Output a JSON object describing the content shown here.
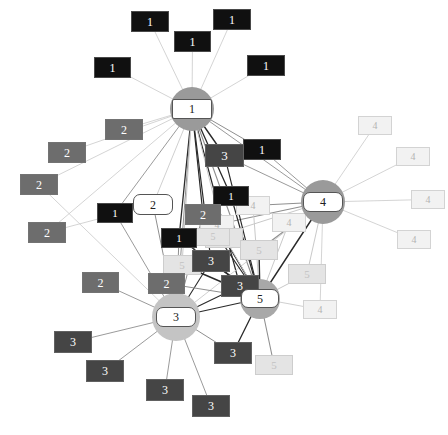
{
  "diagram": {
    "type": "node-link-graph",
    "width": 448,
    "height": 435,
    "background": "#ffffff"
  },
  "palette": {
    "class_1": "#101010",
    "class_1_text": "#ffffff",
    "class_2": "#6d6d6d",
    "class_2_text": "#ffffff",
    "class_3": "#454545",
    "class_3_text": "#ffffff",
    "class_4": "#f2f2f2",
    "class_4_text": "#b4b4b4",
    "class_5": "#e4e4e4",
    "class_5_text": "#c2c2c2",
    "hub_fill": "#ffffff",
    "hub_text": "#202020",
    "hub_border": "#555555",
    "halo_dark": "#9a9a9a",
    "halo_light": "#cfcfcf",
    "edge_light": "#c9c9c9",
    "edge_mid": "#8f8f8f",
    "edge_dark": "#2a2a2a"
  },
  "hubs": [
    {
      "id": "hub1",
      "label": "1",
      "x": 172,
      "y": 99,
      "w": 40,
      "h": 20,
      "halo_r": 22,
      "halo": "#9a9a9a",
      "shape": "octagon"
    },
    {
      "id": "hub4",
      "label": "4",
      "x": 303,
      "y": 192,
      "w": 40,
      "h": 20,
      "halo_r": 22,
      "halo": "#9a9a9a",
      "shape": "rect"
    },
    {
      "id": "hub3",
      "label": "3",
      "x": 156,
      "y": 307,
      "w": 40,
      "h": 20,
      "halo_r": 24,
      "halo": "#c4c4c4",
      "shape": "rect"
    },
    {
      "id": "hub5",
      "label": "5",
      "x": 241,
      "y": 289,
      "w": 38,
      "h": 19,
      "halo_r": 20,
      "halo": "#a8a8a8",
      "shape": "rect"
    },
    {
      "id": "hub2",
      "label": "2",
      "x": 133,
      "y": 194,
      "w": 40,
      "h": 21,
      "halo_r": 0,
      "halo": "none",
      "shape": "rect"
    }
  ],
  "leaves": [
    {
      "id": "n1a",
      "label": "1",
      "cls": "class_1",
      "x": 131,
      "y": 11,
      "w": 38,
      "h": 21
    },
    {
      "id": "n1b",
      "label": "1",
      "cls": "class_1",
      "x": 213,
      "y": 9,
      "w": 38,
      "h": 21
    },
    {
      "id": "n1c",
      "label": "1",
      "cls": "class_1",
      "x": 174,
      "y": 31,
      "w": 37,
      "h": 21
    },
    {
      "id": "n1d",
      "label": "1",
      "cls": "class_1",
      "x": 94,
      "y": 57,
      "w": 37,
      "h": 21
    },
    {
      "id": "n1e",
      "label": "1",
      "cls": "class_1",
      "x": 247,
      "y": 55,
      "w": 38,
      "h": 21
    },
    {
      "id": "n1f",
      "label": "1",
      "cls": "class_1",
      "x": 243,
      "y": 139,
      "w": 38,
      "h": 21
    },
    {
      "id": "n1g",
      "label": "1",
      "cls": "class_1",
      "x": 97,
      "y": 203,
      "w": 36,
      "h": 20
    },
    {
      "id": "n1h",
      "label": "1",
      "cls": "class_1",
      "x": 213,
      "y": 186,
      "w": 36,
      "h": 20
    },
    {
      "id": "n1i",
      "label": "1",
      "cls": "class_1",
      "x": 161,
      "y": 228,
      "w": 36,
      "h": 20
    },
    {
      "id": "n2a",
      "label": "2",
      "cls": "class_2",
      "x": 105,
      "y": 119,
      "w": 38,
      "h": 21
    },
    {
      "id": "n2b",
      "label": "2",
      "cls": "class_2",
      "x": 48,
      "y": 142,
      "w": 38,
      "h": 21
    },
    {
      "id": "n2c",
      "label": "2",
      "cls": "class_2",
      "x": 20,
      "y": 174,
      "w": 38,
      "h": 21
    },
    {
      "id": "n2d",
      "label": "2",
      "cls": "class_2",
      "x": 28,
      "y": 222,
      "w": 38,
      "h": 21
    },
    {
      "id": "n2e",
      "label": "2",
      "cls": "class_2",
      "x": 185,
      "y": 204,
      "w": 36,
      "h": 21
    },
    {
      "id": "n2f",
      "label": "2",
      "cls": "class_2",
      "x": 82,
      "y": 272,
      "w": 37,
      "h": 21
    },
    {
      "id": "n2g",
      "label": "2",
      "cls": "class_2",
      "x": 148,
      "y": 273,
      "w": 37,
      "h": 21
    },
    {
      "id": "n3a",
      "label": "3",
      "cls": "class_3",
      "x": 205,
      "y": 144,
      "w": 39,
      "h": 23
    },
    {
      "id": "n3b",
      "label": "3",
      "cls": "class_3",
      "x": 192,
      "y": 250,
      "w": 38,
      "h": 22
    },
    {
      "id": "n3c",
      "label": "3",
      "cls": "class_3",
      "x": 221,
      "y": 275,
      "w": 38,
      "h": 22
    },
    {
      "id": "n3d",
      "label": "3",
      "cls": "class_3",
      "x": 54,
      "y": 331,
      "w": 38,
      "h": 22
    },
    {
      "id": "n3e",
      "label": "3",
      "cls": "class_3",
      "x": 86,
      "y": 360,
      "w": 38,
      "h": 22
    },
    {
      "id": "n3f",
      "label": "3",
      "cls": "class_3",
      "x": 146,
      "y": 379,
      "w": 38,
      "h": 22
    },
    {
      "id": "n3g",
      "label": "3",
      "cls": "class_3",
      "x": 192,
      "y": 395,
      "w": 38,
      "h": 22
    },
    {
      "id": "n3h",
      "label": "3",
      "cls": "class_3",
      "x": 214,
      "y": 342,
      "w": 38,
      "h": 22
    },
    {
      "id": "n4a",
      "label": "4",
      "cls": "class_4",
      "x": 358,
      "y": 116,
      "w": 34,
      "h": 19
    },
    {
      "id": "n4b",
      "label": "4",
      "cls": "class_4",
      "x": 396,
      "y": 147,
      "w": 34,
      "h": 19
    },
    {
      "id": "n4c",
      "label": "4",
      "cls": "class_4",
      "x": 411,
      "y": 190,
      "w": 34,
      "h": 19
    },
    {
      "id": "n4d",
      "label": "4",
      "cls": "class_4",
      "x": 397,
      "y": 230,
      "w": 34,
      "h": 19
    },
    {
      "id": "n4e",
      "label": "4",
      "cls": "class_4",
      "x": 236,
      "y": 196,
      "w": 34,
      "h": 19
    },
    {
      "id": "n4f",
      "label": "4",
      "cls": "class_4",
      "x": 272,
      "y": 213,
      "w": 34,
      "h": 19
    },
    {
      "id": "n4g",
      "label": "4",
      "cls": "class_4",
      "x": 200,
      "y": 215,
      "w": 34,
      "h": 19
    },
    {
      "id": "n4h",
      "label": "4",
      "cls": "class_4",
      "x": 303,
      "y": 300,
      "w": 34,
      "h": 19
    },
    {
      "id": "n5a",
      "label": "5",
      "cls": "class_5",
      "x": 163,
      "y": 255,
      "w": 38,
      "h": 20
    },
    {
      "id": "n5b",
      "label": "5",
      "cls": "class_5",
      "x": 205,
      "y": 228,
      "w": 38,
      "h": 20
    },
    {
      "id": "n5c",
      "label": "5",
      "cls": "class_5",
      "x": 240,
      "y": 240,
      "w": 38,
      "h": 20
    },
    {
      "id": "n5d",
      "label": "5",
      "cls": "class_5",
      "x": 288,
      "y": 264,
      "w": 38,
      "h": 20
    },
    {
      "id": "n5e",
      "label": "5",
      "cls": "class_5",
      "x": 255,
      "y": 355,
      "w": 38,
      "h": 20
    },
    {
      "id": "n5f",
      "label": "5",
      "cls": "class_5",
      "x": 196,
      "y": 228,
      "w": 34,
      "h": 18
    }
  ],
  "edges": [
    {
      "from": "n1a",
      "to": "hub1",
      "w": 0.8,
      "c": "edge_light"
    },
    {
      "from": "n1b",
      "to": "hub1",
      "w": 0.8,
      "c": "edge_light"
    },
    {
      "from": "n1c",
      "to": "hub1",
      "w": 0.8,
      "c": "edge_light"
    },
    {
      "from": "n1d",
      "to": "hub1",
      "w": 0.8,
      "c": "edge_light"
    },
    {
      "from": "n1e",
      "to": "hub1",
      "w": 0.8,
      "c": "edge_light"
    },
    {
      "from": "n2a",
      "to": "hub1",
      "w": 0.8,
      "c": "edge_light"
    },
    {
      "from": "n2b",
      "to": "hub1",
      "w": 0.8,
      "c": "edge_light"
    },
    {
      "from": "n2c",
      "to": "hub1",
      "w": 0.8,
      "c": "edge_light"
    },
    {
      "from": "n2d",
      "to": "hub1",
      "w": 0.8,
      "c": "edge_light"
    },
    {
      "from": "hub2",
      "to": "hub1",
      "w": 0.9,
      "c": "edge_light"
    },
    {
      "from": "n3a",
      "to": "hub1",
      "w": 1.4,
      "c": "edge_dark"
    },
    {
      "from": "n1f",
      "to": "hub1",
      "w": 1.0,
      "c": "edge_mid"
    },
    {
      "from": "n1g",
      "to": "hub1",
      "w": 0.9,
      "c": "edge_mid"
    },
    {
      "from": "n1h",
      "to": "hub1",
      "w": 1.3,
      "c": "edge_dark"
    },
    {
      "from": "n1i",
      "to": "hub1",
      "w": 1.3,
      "c": "edge_dark"
    },
    {
      "from": "n2e",
      "to": "hub1",
      "w": 1.2,
      "c": "edge_dark"
    },
    {
      "from": "n3b",
      "to": "hub1",
      "w": 1.2,
      "c": "edge_dark"
    },
    {
      "from": "n3c",
      "to": "hub1",
      "w": 1.2,
      "c": "edge_dark"
    },
    {
      "from": "hub3",
      "to": "hub1",
      "w": 1.0,
      "c": "edge_mid"
    },
    {
      "from": "hub5",
      "to": "hub1",
      "w": 1.1,
      "c": "edge_mid"
    },
    {
      "from": "hub4",
      "to": "hub1",
      "w": 0.9,
      "c": "edge_mid"
    },
    {
      "from": "n5a",
      "to": "hub1",
      "w": 1.0,
      "c": "edge_light"
    },
    {
      "from": "n5b",
      "to": "hub1",
      "w": 1.0,
      "c": "edge_light"
    },
    {
      "from": "n4a",
      "to": "hub4",
      "w": 0.8,
      "c": "edge_light"
    },
    {
      "from": "n4b",
      "to": "hub4",
      "w": 0.8,
      "c": "edge_light"
    },
    {
      "from": "n4c",
      "to": "hub4",
      "w": 0.8,
      "c": "edge_light"
    },
    {
      "from": "n4d",
      "to": "hub4",
      "w": 0.8,
      "c": "edge_light"
    },
    {
      "from": "n4e",
      "to": "hub4",
      "w": 1.2,
      "c": "edge_mid"
    },
    {
      "from": "n4f",
      "to": "hub4",
      "w": 1.2,
      "c": "edge_mid"
    },
    {
      "from": "n4g",
      "to": "hub4",
      "w": 1.1,
      "c": "edge_mid"
    },
    {
      "from": "n4h",
      "to": "hub4",
      "w": 0.8,
      "c": "edge_light"
    },
    {
      "from": "n5c",
      "to": "hub4",
      "w": 1.2,
      "c": "edge_mid"
    },
    {
      "from": "n5d",
      "to": "hub4",
      "w": 1.0,
      "c": "edge_light"
    },
    {
      "from": "n1f",
      "to": "hub4",
      "w": 0.9,
      "c": "edge_mid"
    },
    {
      "from": "n3a",
      "to": "hub4",
      "w": 0.9,
      "c": "edge_mid"
    },
    {
      "from": "hub5",
      "to": "hub4",
      "w": 1.4,
      "c": "edge_dark"
    },
    {
      "from": "hub3",
      "to": "hub4",
      "w": 0.9,
      "c": "edge_light"
    },
    {
      "from": "n2f",
      "to": "hub3",
      "w": 0.9,
      "c": "edge_mid"
    },
    {
      "from": "n2g",
      "to": "hub3",
      "w": 1.0,
      "c": "edge_mid"
    },
    {
      "from": "n3d",
      "to": "hub3",
      "w": 0.9,
      "c": "edge_mid"
    },
    {
      "from": "n3e",
      "to": "hub3",
      "w": 0.9,
      "c": "edge_mid"
    },
    {
      "from": "n3f",
      "to": "hub3",
      "w": 0.9,
      "c": "edge_mid"
    },
    {
      "from": "n3g",
      "to": "hub3",
      "w": 0.9,
      "c": "edge_mid"
    },
    {
      "from": "n3h",
      "to": "hub3",
      "w": 1.0,
      "c": "edge_mid"
    },
    {
      "from": "n3b",
      "to": "hub3",
      "w": 1.1,
      "c": "edge_dark"
    },
    {
      "from": "n3c",
      "to": "hub3",
      "w": 1.1,
      "c": "edge_dark"
    },
    {
      "from": "hub2",
      "to": "hub3",
      "w": 1.0,
      "c": "edge_mid"
    },
    {
      "from": "n1g",
      "to": "hub3",
      "w": 0.9,
      "c": "edge_mid"
    },
    {
      "from": "n5a",
      "to": "hub3",
      "w": 1.0,
      "c": "edge_light"
    },
    {
      "from": "hub5",
      "to": "hub3",
      "w": 1.2,
      "c": "edge_dark"
    },
    {
      "from": "n2e",
      "to": "hub3",
      "w": 1.0,
      "c": "edge_mid"
    },
    {
      "from": "n1i",
      "to": "hub3",
      "w": 1.0,
      "c": "edge_mid"
    },
    {
      "from": "n5c",
      "to": "hub5",
      "w": 1.4,
      "c": "edge_dark"
    },
    {
      "from": "n5b",
      "to": "hub5",
      "w": 1.4,
      "c": "edge_dark"
    },
    {
      "from": "n5a",
      "to": "hub5",
      "w": 1.4,
      "c": "edge_dark"
    },
    {
      "from": "n5d",
      "to": "hub5",
      "w": 1.0,
      "c": "edge_light"
    },
    {
      "from": "n5e",
      "to": "hub5",
      "w": 1.1,
      "c": "edge_mid"
    },
    {
      "from": "n3b",
      "to": "hub5",
      "w": 1.4,
      "c": "edge_dark"
    },
    {
      "from": "n3c",
      "to": "hub5",
      "w": 1.4,
      "c": "edge_dark"
    },
    {
      "from": "n3h",
      "to": "hub5",
      "w": 1.3,
      "c": "edge_dark"
    },
    {
      "from": "n4g",
      "to": "hub5",
      "w": 1.0,
      "c": "edge_light"
    },
    {
      "from": "n4h",
      "to": "hub5",
      "w": 0.9,
      "c": "edge_light"
    },
    {
      "from": "n4f",
      "to": "hub5",
      "w": 1.0,
      "c": "edge_light"
    },
    {
      "from": "n2e",
      "to": "hub5",
      "w": 1.2,
      "c": "edge_dark"
    },
    {
      "from": "n1i",
      "to": "hub5",
      "w": 1.2,
      "c": "edge_dark"
    },
    {
      "from": "n1h",
      "to": "hub5",
      "w": 1.2,
      "c": "edge_dark"
    },
    {
      "from": "n2g",
      "to": "hub5",
      "w": 1.0,
      "c": "edge_mid"
    },
    {
      "from": "n1g",
      "to": "hub2",
      "w": 0.9,
      "c": "edge_mid"
    },
    {
      "from": "n2d",
      "to": "hub2",
      "w": 0.8,
      "c": "edge_light"
    },
    {
      "from": "n2c",
      "to": "hub3",
      "w": 0.8,
      "c": "edge_light"
    },
    {
      "from": "n4e",
      "to": "hub5",
      "w": 1.0,
      "c": "edge_light"
    },
    {
      "from": "n5f",
      "to": "hub4",
      "w": 1.0,
      "c": "edge_light"
    },
    {
      "from": "n3a",
      "to": "hub5",
      "w": 1.1,
      "c": "edge_dark"
    }
  ]
}
